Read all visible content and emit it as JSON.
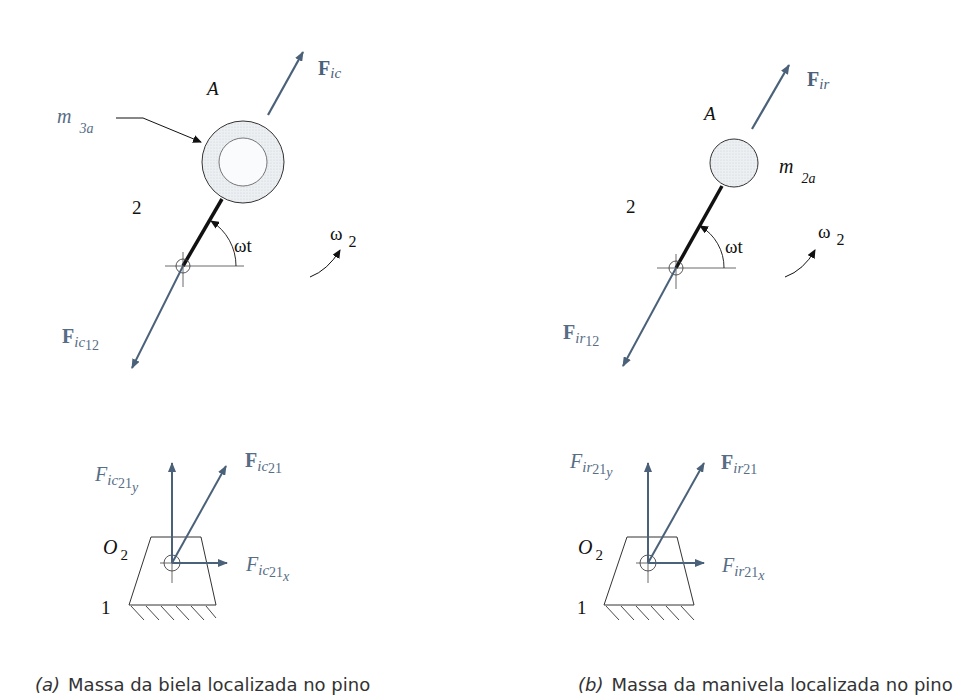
{
  "colors": {
    "force_vector": "#4a6179",
    "label_blue": "#566d85",
    "ink": "#111111",
    "mass_fill": "#e8ebef",
    "caption": "#333333"
  },
  "panel_a": {
    "point_label": "A",
    "mass_label": "m",
    "mass_sub": "3a",
    "link_label": "2",
    "angle_label": "ωt",
    "omega_label": "ω",
    "omega_sub": "2",
    "force_top": {
      "main": "F",
      "sub": "ic"
    },
    "force_bottom": {
      "main": "F",
      "sub": "ic",
      "subsub": "12"
    },
    "reaction_resultant": {
      "main": "F",
      "sub": "ic",
      "subsub": "21"
    },
    "reaction_y": {
      "main": "F",
      "sub": "ic",
      "subsub": "21",
      "axis": "y"
    },
    "reaction_x": {
      "main": "F",
      "sub": "ic",
      "subsub": "21",
      "axis": "x"
    },
    "pivot_label": "O",
    "pivot_sub": "2",
    "ground_label": "1",
    "caption_tag": "(a)",
    "caption_text": "Massa da biela localizada no pino"
  },
  "panel_b": {
    "point_label": "A",
    "mass_label": "m",
    "mass_sub": "2a",
    "link_label": "2",
    "angle_label": "ωt",
    "omega_label": "ω",
    "omega_sub": "2",
    "force_top": {
      "main": "F",
      "sub": "ir"
    },
    "force_bottom": {
      "main": "F",
      "sub": "ir",
      "subsub": "12"
    },
    "reaction_resultant": {
      "main": "F",
      "sub": "ir",
      "subsub": "21"
    },
    "reaction_y": {
      "main": "F",
      "sub": "ir",
      "subsub": "21",
      "axis": "y"
    },
    "reaction_x": {
      "main": "F",
      "sub": "ir",
      "subsub": "21",
      "axis": "x"
    },
    "pivot_label": "O",
    "pivot_sub": "2",
    "ground_label": "1",
    "caption_tag": "(b)",
    "caption_text": "Massa da manivela localizada no pino"
  }
}
